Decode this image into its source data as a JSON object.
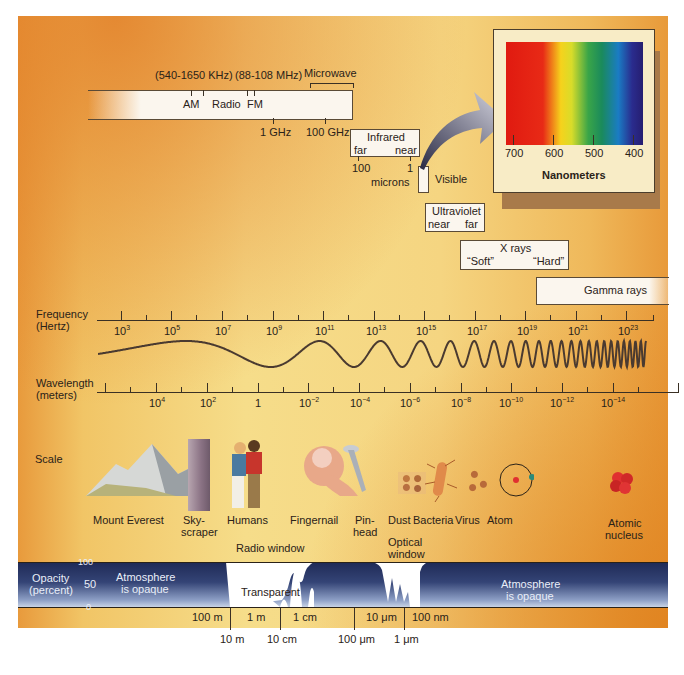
{
  "radio": {
    "am_range": "(540-1650 KHz)",
    "fm_range": "(88-108 MHz)",
    "microwave_label": "Microwave",
    "am_label": "AM",
    "radio_label": "Radio",
    "fm_label": "FM",
    "tick_1ghz": "1 GHz",
    "tick_100ghz": "100 GHz"
  },
  "infrared": {
    "title": "Infrared",
    "far": "far",
    "near": "near",
    "tick_100": "100",
    "tick_1": "1",
    "unit": "microns"
  },
  "visible": {
    "label": "Visible"
  },
  "spectrum_inset": {
    "ticks": [
      "700",
      "600",
      "500",
      "400"
    ],
    "unit": "Nanometers"
  },
  "ultraviolet": {
    "title": "Ultraviolet",
    "near": "near",
    "far": "far"
  },
  "xrays": {
    "title": "X rays",
    "soft": "“Soft”",
    "hard": "“Hard”"
  },
  "gamma": {
    "title": "Gamma rays"
  },
  "frequency_axis": {
    "label_line1": "Frequency",
    "label_line2": "(Hertz)",
    "ticks": [
      {
        "base": "10",
        "exp": "3"
      },
      {
        "base": "10",
        "exp": "5"
      },
      {
        "base": "10",
        "exp": "7"
      },
      {
        "base": "10",
        "exp": "9"
      },
      {
        "base": "10",
        "exp": "11"
      },
      {
        "base": "10",
        "exp": "13"
      },
      {
        "base": "10",
        "exp": "15"
      },
      {
        "base": "10",
        "exp": "17"
      },
      {
        "base": "10",
        "exp": "19"
      },
      {
        "base": "10",
        "exp": "21"
      },
      {
        "base": "10",
        "exp": "23"
      }
    ]
  },
  "wavelength_axis": {
    "label_line1": "Wavelength",
    "label_line2": "(meters)",
    "ticks": [
      {
        "base": "10",
        "exp": "4"
      },
      {
        "base": "10",
        "exp": "2"
      },
      {
        "base": "1",
        "exp": ""
      },
      {
        "base": "10",
        "exp": "−2"
      },
      {
        "base": "10",
        "exp": "−4"
      },
      {
        "base": "10",
        "exp": "−6"
      },
      {
        "base": "10",
        "exp": "−8"
      },
      {
        "base": "10",
        "exp": "−10"
      },
      {
        "base": "10",
        "exp": "−12"
      },
      {
        "base": "10",
        "exp": "−14"
      }
    ]
  },
  "scale": {
    "label": "Scale",
    "items": [
      {
        "line1": "Mount Everest",
        "line2": ""
      },
      {
        "line1": "Sky-",
        "line2": "scraper"
      },
      {
        "line1": "Humans",
        "line2": ""
      },
      {
        "line1": "Fingernail",
        "line2": ""
      },
      {
        "line1": "Pin-",
        "line2": "head"
      },
      {
        "line1": "Dust",
        "line2": ""
      },
      {
        "line1": "Bacteria",
        "line2": ""
      },
      {
        "line1": "Virus",
        "line2": ""
      },
      {
        "line1": "Atom",
        "line2": ""
      },
      {
        "line1": "Atomic",
        "line2": "nucleus"
      }
    ]
  },
  "opacity": {
    "label_line1": "Opacity",
    "label_line2": "(percent)",
    "y_ticks": [
      "100",
      "50",
      "0"
    ],
    "radio_window": "Radio window",
    "optical_window_line1": "Optical",
    "optical_window_line2": "window",
    "transparent": "Transparent",
    "opaque_left_line1": "Atmosphere",
    "opaque_left_line2": "is opaque",
    "opaque_right_line1": "Atmosphere",
    "opaque_right_line2": "is opaque",
    "wavelength_ticks_upper": [
      "100 m",
      "1 m",
      "1 cm",
      "10 μm",
      "100 nm"
    ],
    "wavelength_ticks_lower": [
      "10 m",
      "10 cm",
      "100 μm",
      "1 μm"
    ]
  }
}
